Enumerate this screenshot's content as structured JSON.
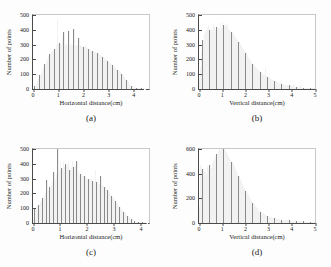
{
  "figure": {
    "background": "#fdfdfd",
    "bar_color": "#8a8a8a",
    "axis_color": "#4a4a4a"
  },
  "chart_data": [
    {
      "id": "a",
      "type": "bar",
      "title": "",
      "caption": "(a)",
      "xlabel": "Horizontal distance(cm)",
      "ylabel": "Number of points",
      "xlim": [
        0,
        4.6
      ],
      "ylim": [
        0,
        500
      ],
      "xticks": [
        0,
        1,
        2,
        3,
        4
      ],
      "yticks": [
        0,
        100,
        200,
        300,
        400,
        500
      ],
      "grid": false,
      "bin_width": 0.05,
      "x": [
        0.025,
        0.075,
        0.125,
        0.175,
        0.225,
        0.275,
        0.325,
        0.375,
        0.425,
        0.475,
        0.525,
        0.575,
        0.625,
        0.675,
        0.725,
        0.775,
        0.825,
        0.875,
        0.925,
        0.975,
        1.025,
        1.075,
        1.125,
        1.175,
        1.225,
        1.275,
        1.325,
        1.375,
        1.425,
        1.475,
        1.525,
        1.575,
        1.625,
        1.675,
        1.725,
        1.775,
        1.825,
        1.875,
        1.925,
        1.975,
        2.025,
        2.075,
        2.125,
        2.175,
        2.225,
        2.275,
        2.325,
        2.375,
        2.425,
        2.475,
        2.525,
        2.575,
        2.625,
        2.675,
        2.725,
        2.775,
        2.825,
        2.875,
        2.925,
        2.975,
        3.025,
        3.075,
        3.125,
        3.175,
        3.225,
        3.275,
        3.325,
        3.375,
        3.425,
        3.475,
        3.525,
        3.575,
        3.625,
        3.675,
        3.725,
        3.775,
        3.825,
        3.875,
        3.925,
        3.975,
        4.025,
        4.075,
        4.125,
        4.175,
        4.225,
        4.275,
        4.325,
        4.375,
        4.425,
        4.475
      ],
      "values": [
        8,
        18,
        35,
        52,
        70,
        92,
        110,
        128,
        150,
        168,
        185,
        205,
        222,
        238,
        252,
        258,
        262,
        268,
        300,
        465,
        305,
        312,
        300,
        355,
        382,
        300,
        310,
        300,
        390,
        302,
        300,
        300,
        405,
        290,
        295,
        300,
        348,
        300,
        292,
        290,
        285,
        300,
        282,
        278,
        272,
        265,
        258,
        255,
        250,
        248,
        245,
        240,
        232,
        228,
        222,
        215,
        208,
        200,
        195,
        188,
        182,
        175,
        168,
        160,
        152,
        145,
        138,
        130,
        122,
        112,
        102,
        92,
        82,
        70,
        58,
        46,
        35,
        26,
        20,
        15,
        12,
        10,
        8,
        7,
        7,
        6,
        5,
        4,
        3,
        2
      ]
    },
    {
      "id": "b",
      "type": "bar",
      "title": "",
      "caption": "(b)",
      "xlabel": "Vertical distance(cm)",
      "ylabel": "Number of points",
      "xlim": [
        0,
        5
      ],
      "ylim": [
        0,
        500
      ],
      "xticks": [
        0,
        1,
        2,
        3,
        4,
        5
      ],
      "yticks": [
        0,
        100,
        200,
        300,
        400,
        500
      ],
      "grid": false,
      "bin_width": 0.05,
      "x": [
        0.025,
        0.075,
        0.125,
        0.175,
        0.225,
        0.275,
        0.325,
        0.375,
        0.425,
        0.475,
        0.525,
        0.575,
        0.625,
        0.675,
        0.725,
        0.775,
        0.825,
        0.875,
        0.925,
        0.975,
        1.025,
        1.075,
        1.125,
        1.175,
        1.225,
        1.275,
        1.325,
        1.375,
        1.425,
        1.475,
        1.525,
        1.575,
        1.625,
        1.675,
        1.725,
        1.775,
        1.825,
        1.875,
        1.925,
        1.975,
        2.025,
        2.075,
        2.125,
        2.175,
        2.225,
        2.275,
        2.325,
        2.375,
        2.425,
        2.475,
        2.525,
        2.575,
        2.625,
        2.675,
        2.725,
        2.775,
        2.825,
        2.875,
        2.925,
        2.975,
        3.025,
        3.075,
        3.125,
        3.175,
        3.225,
        3.275,
        3.325,
        3.375,
        3.425,
        3.475,
        3.525,
        3.575,
        3.625,
        3.675,
        3.725,
        3.775,
        3.825,
        3.875,
        3.925,
        3.975,
        4.025,
        4.075,
        4.125,
        4.175,
        4.225,
        4.275,
        4.325,
        4.375,
        4.425,
        4.475,
        4.525,
        4.575,
        4.625,
        4.675,
        4.725,
        4.775,
        4.825,
        4.875,
        4.925,
        4.975
      ],
      "values": [
        60,
        150,
        255,
        330,
        370,
        392,
        400,
        412,
        430,
        400,
        415,
        395,
        440,
        420,
        400,
        420,
        410,
        405,
        448,
        415,
        455,
        430,
        425,
        440,
        430,
        408,
        400,
        395,
        385,
        372,
        360,
        350,
        340,
        330,
        318,
        305,
        292,
        280,
        268,
        255,
        242,
        230,
        218,
        205,
        195,
        182,
        170,
        160,
        150,
        140,
        132,
        122,
        130,
        112,
        105,
        98,
        92,
        140,
        85,
        80,
        76,
        72,
        68,
        64,
        60,
        56,
        52,
        48,
        45,
        42,
        38,
        35,
        32,
        30,
        28,
        26,
        24,
        22,
        30,
        20,
        18,
        32,
        16,
        15,
        14,
        13,
        12,
        30,
        11,
        10,
        10,
        9,
        9,
        8,
        8,
        7,
        7,
        6,
        6,
        5
      ]
    },
    {
      "id": "c",
      "type": "bar",
      "title": "",
      "caption": "(c)",
      "xlabel": "Horizontal distance(cm)",
      "ylabel": "Number of points",
      "xlim": [
        0,
        4.3
      ],
      "ylim": [
        0,
        500
      ],
      "xticks": [
        0,
        1,
        2,
        3,
        4
      ],
      "yticks": [
        0,
        100,
        200,
        300,
        400,
        500
      ],
      "grid": false,
      "bin_width": 0.05,
      "x": [
        0.025,
        0.075,
        0.125,
        0.175,
        0.225,
        0.275,
        0.325,
        0.375,
        0.425,
        0.475,
        0.525,
        0.575,
        0.625,
        0.675,
        0.725,
        0.775,
        0.825,
        0.875,
        0.925,
        0.975,
        1.025,
        1.075,
        1.125,
        1.175,
        1.225,
        1.275,
        1.325,
        1.375,
        1.425,
        1.475,
        1.525,
        1.575,
        1.625,
        1.675,
        1.725,
        1.775,
        1.825,
        1.875,
        1.925,
        1.975,
        2.025,
        2.075,
        2.125,
        2.175,
        2.225,
        2.275,
        2.325,
        2.375,
        2.425,
        2.475,
        2.525,
        2.575,
        2.625,
        2.675,
        2.725,
        2.775,
        2.825,
        2.875,
        2.925,
        2.975,
        3.025,
        3.075,
        3.125,
        3.175,
        3.225,
        3.275,
        3.325,
        3.375,
        3.425,
        3.475,
        3.525,
        3.575,
        3.625,
        3.675,
        3.725,
        3.775,
        3.825,
        3.875,
        3.925,
        3.975,
        4.025,
        4.075,
        4.125,
        4.175,
        4.225
      ],
      "values": [
        25,
        100,
        105,
        118,
        125,
        140,
        155,
        170,
        185,
        200,
        288,
        225,
        240,
        260,
        285,
        345,
        300,
        330,
        500,
        350,
        410,
        375,
        420,
        385,
        400,
        390,
        420,
        360,
        372,
        420,
        380,
        390,
        420,
        350,
        330,
        328,
        320,
        318,
        315,
        305,
        300,
        295,
        290,
        300,
        285,
        280,
        360,
        275,
        268,
        262,
        315,
        255,
        248,
        240,
        232,
        222,
        210,
        198,
        185,
        172,
        160,
        148,
        135,
        122,
        108,
        95,
        85,
        75,
        65,
        55,
        46,
        38,
        30,
        24,
        20,
        16,
        13,
        10,
        8,
        7,
        18,
        6,
        5,
        4,
        3
      ]
    },
    {
      "id": "d",
      "type": "bar",
      "title": "",
      "caption": "(d)",
      "xlabel": "Vertical distance(cm)",
      "ylabel": "Number of points",
      "xlim": [
        0,
        5
      ],
      "ylim": [
        0,
        600
      ],
      "xticks": [
        0,
        1,
        2,
        3,
        4,
        5
      ],
      "yticks": [
        0,
        200,
        400,
        600
      ],
      "grid": false,
      "bin_width": 0.05,
      "x": [
        0.025,
        0.075,
        0.125,
        0.175,
        0.225,
        0.275,
        0.325,
        0.375,
        0.425,
        0.475,
        0.525,
        0.575,
        0.625,
        0.675,
        0.725,
        0.775,
        0.825,
        0.875,
        0.925,
        0.975,
        1.025,
        1.075,
        1.125,
        1.175,
        1.225,
        1.275,
        1.325,
        1.375,
        1.425,
        1.475,
        1.525,
        1.575,
        1.625,
        1.675,
        1.725,
        1.775,
        1.825,
        1.875,
        1.925,
        1.975,
        2.025,
        2.075,
        2.125,
        2.175,
        2.225,
        2.275,
        2.325,
        2.375,
        2.425,
        2.475,
        2.525,
        2.575,
        2.625,
        2.675,
        2.725,
        2.775,
        2.825,
        2.875,
        2.925,
        2.975,
        3.025,
        3.075,
        3.125,
        3.175,
        3.225,
        3.275,
        3.325,
        3.375,
        3.425,
        3.475,
        3.525,
        3.575,
        3.625,
        3.675,
        3.725,
        3.775,
        3.825,
        3.875,
        3.925,
        3.975,
        4.025,
        4.075,
        4.125,
        4.175,
        4.225,
        4.275,
        4.325,
        4.375,
        4.425,
        4.475,
        4.525,
        4.575,
        4.625,
        4.675,
        4.725,
        4.775,
        4.825,
        4.875,
        4.925,
        4.975
      ],
      "values": [
        130,
        470,
        460,
        440,
        425,
        410,
        395,
        460,
        440,
        470,
        450,
        490,
        505,
        520,
        540,
        560,
        580,
        600,
        595,
        615,
        612,
        600,
        590,
        575,
        560,
        545,
        530,
        512,
        495,
        478,
        460,
        440,
        420,
        400,
        380,
        360,
        340,
        320,
        300,
        282,
        262,
        245,
        228,
        210,
        195,
        180,
        165,
        152,
        140,
        128,
        118,
        108,
        100,
        92,
        85,
        78,
        72,
        66,
        60,
        56,
        52,
        48,
        45,
        42,
        40,
        38,
        36,
        34,
        32,
        30,
        28,
        27,
        26,
        25,
        24,
        23,
        22,
        30,
        21,
        20,
        19,
        18,
        17,
        25,
        16,
        15,
        15,
        14,
        14,
        13,
        13,
        12,
        12,
        11,
        11,
        10,
        10,
        9,
        28,
        9
      ]
    }
  ]
}
